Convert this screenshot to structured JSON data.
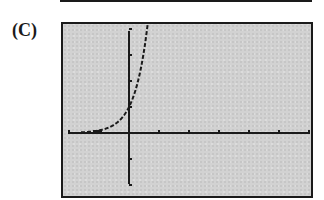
{
  "label": "(C)",
  "chart_data": {
    "type": "line",
    "title": "",
    "xlabel": "",
    "ylabel": "",
    "function": "y = 10^x (exponential growth, graphing-calculator dot-style plot)",
    "xlim": [
      -2,
      6
    ],
    "ylim": [
      -2,
      4
    ],
    "xtick_step": 1,
    "ytick_step": 1,
    "grid": false,
    "legend": null,
    "x": [
      -2,
      -1.5,
      -1,
      -0.75,
      -0.5,
      -0.25,
      0,
      0.25,
      0.4,
      0.5,
      0.6
    ],
    "values": [
      0.01,
      0.03,
      0.1,
      0.18,
      0.32,
      0.56,
      1,
      1.78,
      2.51,
      3.16,
      3.98
    ],
    "annotations": []
  },
  "colors": {
    "screen_bg": "#d2d2d2",
    "ink": "#1a1a1a",
    "page_bg": "#ffffff"
  }
}
